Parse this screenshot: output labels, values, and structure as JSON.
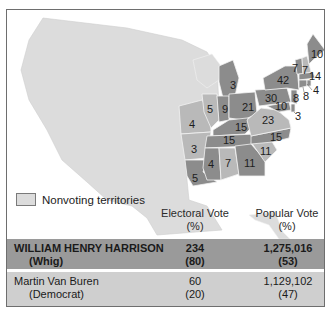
{
  "map": {
    "title": "Election of 1840",
    "colors": {
      "whig": "#8c8c8c",
      "democrat": "#b9b9b9",
      "nonvoting": "#dcdcdc",
      "water": "#ffffff",
      "border": "#f2f2f2"
    },
    "state_labels": [
      {
        "state": "Maine",
        "votes": "10",
        "party": "whig"
      },
      {
        "state": "Vermont",
        "votes": "7",
        "party": "whig"
      },
      {
        "state": "New Hampshire",
        "votes": "7",
        "party": "democrat"
      },
      {
        "state": "Massachusetts",
        "votes": "14",
        "party": "whig"
      },
      {
        "state": "Rhode Island",
        "votes": "4",
        "party": "whig"
      },
      {
        "state": "Connecticut",
        "votes": "8",
        "party": "whig"
      },
      {
        "state": "New Jersey",
        "votes": "8",
        "party": "whig"
      },
      {
        "state": "New York",
        "votes": "42",
        "party": "whig"
      },
      {
        "state": "Pennsylvania",
        "votes": "30",
        "party": "whig"
      },
      {
        "state": "Maryland",
        "votes": "10",
        "party": "whig"
      },
      {
        "state": "Delaware",
        "votes": "3",
        "party": "whig"
      },
      {
        "state": "Virginia",
        "votes": "23",
        "party": "democrat"
      },
      {
        "state": "Michigan",
        "votes": "3",
        "party": "whig"
      },
      {
        "state": "Ohio",
        "votes": "21",
        "party": "whig"
      },
      {
        "state": "Indiana",
        "votes": "9",
        "party": "whig"
      },
      {
        "state": "Illinois",
        "votes": "5",
        "party": "democrat"
      },
      {
        "state": "Missouri",
        "votes": "4",
        "party": "democrat"
      },
      {
        "state": "Kentucky",
        "votes": "15",
        "party": "whig"
      },
      {
        "state": "Tennessee",
        "votes": "15",
        "party": "whig"
      },
      {
        "state": "North Carolina",
        "votes": "15",
        "party": "whig"
      },
      {
        "state": "South Carolina",
        "votes": "11",
        "party": "democrat"
      },
      {
        "state": "Georgia",
        "votes": "11",
        "party": "whig"
      },
      {
        "state": "Alabama",
        "votes": "7",
        "party": "democrat"
      },
      {
        "state": "Mississippi",
        "votes": "4",
        "party": "whig"
      },
      {
        "state": "Arkansas",
        "votes": "3",
        "party": "democrat"
      },
      {
        "state": "Louisiana",
        "votes": "5",
        "party": "whig"
      }
    ]
  },
  "legend": {
    "label": "Nonvoting territories"
  },
  "table": {
    "headers": {
      "electoral": "Electoral Vote",
      "electoral_unit": "(%)",
      "popular": "Popular Vote",
      "popular_unit": "(%)"
    },
    "rows": [
      {
        "candidate": "WILLIAM HENRY HARRISON",
        "party": "(Whig)",
        "electoral": "234",
        "electoral_pct": "(80)",
        "popular": "1,275,016",
        "popular_pct": "(53)",
        "winner": true
      },
      {
        "candidate": "Martin Van Buren",
        "party": "(Democrat)",
        "electoral": "60",
        "electoral_pct": "(20)",
        "popular": "1,129,102",
        "popular_pct": "(47)",
        "winner": false
      }
    ]
  }
}
